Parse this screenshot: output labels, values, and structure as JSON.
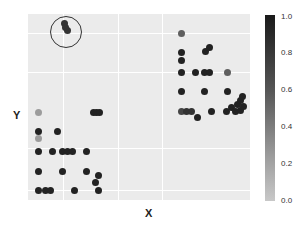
{
  "chart_data": {
    "type": "scatter",
    "title": "",
    "xlabel": "X",
    "ylabel": "Y",
    "grid": true,
    "legend": {
      "type": "colorbar",
      "position": "right",
      "ticks": [
        "1.0",
        "0.8",
        "0.6",
        "0.4",
        "0.2",
        "0.0"
      ],
      "range": [
        0.0,
        1.0
      ]
    },
    "annotation": {
      "type": "circle",
      "description": "highlighted cluster top-left",
      "cx": 37,
      "cy": 17,
      "r": 15
    },
    "points_px_note": "x,y in panel pixel coords (panel 222x186), v = color value 0-1",
    "points": [
      {
        "x": 36,
        "y": 9,
        "v": 0.85
      },
      {
        "x": 39,
        "y": 16,
        "v": 0.85
      },
      {
        "x": 37,
        "y": 13,
        "v": 0.85
      },
      {
        "x": 153,
        "y": 19,
        "v": 0.6
      },
      {
        "x": 177,
        "y": 37,
        "v": 0.95
      },
      {
        "x": 181,
        "y": 33,
        "v": 0.95
      },
      {
        "x": 153,
        "y": 38,
        "v": 0.95
      },
      {
        "x": 153,
        "y": 46,
        "v": 0.95
      },
      {
        "x": 153,
        "y": 58,
        "v": 0.95
      },
      {
        "x": 167,
        "y": 58,
        "v": 0.95
      },
      {
        "x": 176,
        "y": 58,
        "v": 0.95
      },
      {
        "x": 181,
        "y": 58,
        "v": 0.95
      },
      {
        "x": 199,
        "y": 58,
        "v": 0.6
      },
      {
        "x": 153,
        "y": 77,
        "v": 0.95
      },
      {
        "x": 176,
        "y": 77,
        "v": 0.95
      },
      {
        "x": 199,
        "y": 77,
        "v": 0.95
      },
      {
        "x": 153,
        "y": 97,
        "v": 0.75
      },
      {
        "x": 158,
        "y": 97,
        "v": 0.85
      },
      {
        "x": 163,
        "y": 97,
        "v": 0.85
      },
      {
        "x": 169,
        "y": 103,
        "v": 0.95
      },
      {
        "x": 183,
        "y": 97,
        "v": 0.95
      },
      {
        "x": 198,
        "y": 97,
        "v": 0.95
      },
      {
        "x": 203,
        "y": 93,
        "v": 0.95
      },
      {
        "x": 207,
        "y": 97,
        "v": 0.95
      },
      {
        "x": 209,
        "y": 90,
        "v": 0.95
      },
      {
        "x": 212,
        "y": 86,
        "v": 0.95
      },
      {
        "x": 212,
        "y": 96,
        "v": 0.95
      },
      {
        "x": 215,
        "y": 92,
        "v": 0.95
      },
      {
        "x": 214,
        "y": 82,
        "v": 0.95
      },
      {
        "x": 65,
        "y": 98,
        "v": 0.95
      },
      {
        "x": 68,
        "y": 98,
        "v": 0.95
      },
      {
        "x": 71,
        "y": 98,
        "v": 0.95
      },
      {
        "x": 10,
        "y": 98,
        "v": 0.25
      },
      {
        "x": 10,
        "y": 117,
        "v": 0.95
      },
      {
        "x": 29,
        "y": 117,
        "v": 0.95
      },
      {
        "x": 10,
        "y": 124,
        "v": 0.25
      },
      {
        "x": 10,
        "y": 137,
        "v": 0.95
      },
      {
        "x": 24,
        "y": 137,
        "v": 0.95
      },
      {
        "x": 34,
        "y": 137,
        "v": 0.95
      },
      {
        "x": 39,
        "y": 137,
        "v": 0.95
      },
      {
        "x": 44,
        "y": 137,
        "v": 0.95
      },
      {
        "x": 58,
        "y": 137,
        "v": 0.95
      },
      {
        "x": 10,
        "y": 157,
        "v": 0.95
      },
      {
        "x": 34,
        "y": 157,
        "v": 0.95
      },
      {
        "x": 58,
        "y": 157,
        "v": 0.95
      },
      {
        "x": 70,
        "y": 161,
        "v": 0.95
      },
      {
        "x": 67,
        "y": 168,
        "v": 0.95
      },
      {
        "x": 10,
        "y": 176,
        "v": 0.95
      },
      {
        "x": 17,
        "y": 176,
        "v": 0.95
      },
      {
        "x": 22,
        "y": 176,
        "v": 0.95
      },
      {
        "x": 46,
        "y": 176,
        "v": 0.95
      },
      {
        "x": 70,
        "y": 176,
        "v": 0.95
      }
    ],
    "gridlines_px": {
      "x": [
        35,
        90,
        134
      ],
      "y": [
        19,
        58,
        134,
        176
      ]
    }
  },
  "colorbar": {
    "ticks": [
      {
        "label": "1.0",
        "top": 12
      },
      {
        "label": "0.8",
        "top": 48
      },
      {
        "label": "0.6",
        "top": 85
      },
      {
        "label": "0.4",
        "top": 122
      },
      {
        "label": "0.2",
        "top": 159
      },
      {
        "label": "0.0",
        "top": 196
      }
    ]
  },
  "axes": {
    "xlabel": "X",
    "ylabel": "Y"
  }
}
